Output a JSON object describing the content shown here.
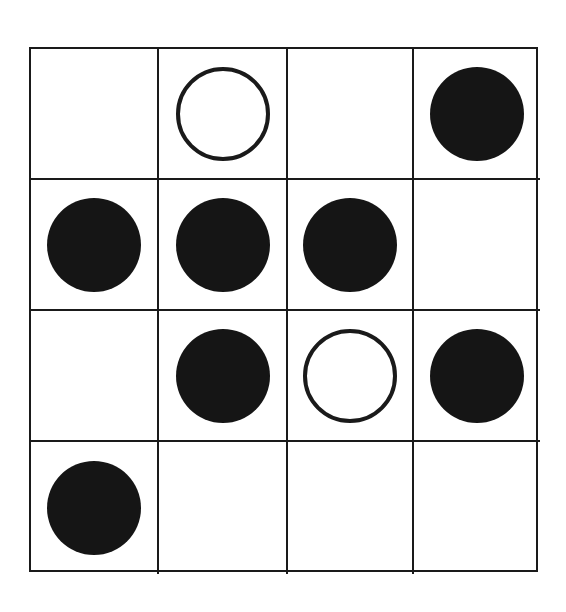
{
  "diagram": {
    "type": "grid-puzzle",
    "rows": 4,
    "cols": 4,
    "colors": {
      "line": "#1a1a1a",
      "filled": "#151515",
      "background": "#ffffff"
    },
    "legend": {
      "filled": "filled-circle",
      "hollow": "hollow-circle",
      "empty": "empty-cell"
    },
    "cells": [
      [
        "empty",
        "hollow",
        "empty",
        "filled"
      ],
      [
        "filled",
        "filled",
        "filled",
        "empty"
      ],
      [
        "empty",
        "filled",
        "hollow",
        "filled"
      ],
      [
        "filled",
        "empty",
        "empty",
        "empty"
      ]
    ]
  }
}
